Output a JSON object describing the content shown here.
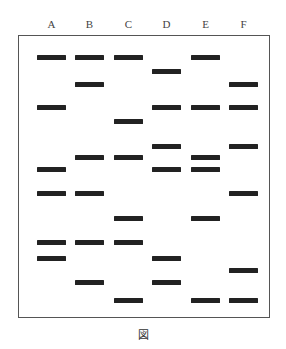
{
  "lanes": [
    {
      "label": "A",
      "x": 37,
      "bands": [
        57,
        107,
        169,
        193,
        242,
        258
      ]
    },
    {
      "label": "B",
      "x": 75,
      "bands": [
        57,
        84,
        157,
        193,
        242,
        282
      ]
    },
    {
      "label": "C",
      "x": 114,
      "bands": [
        57,
        121,
        157,
        218,
        242,
        300
      ]
    },
    {
      "label": "D",
      "x": 152,
      "bands": [
        71,
        107,
        146,
        169,
        258,
        282
      ]
    },
    {
      "label": "E",
      "x": 191,
      "bands": [
        57,
        107,
        157,
        169,
        218,
        300
      ]
    },
    {
      "label": "F",
      "x": 229,
      "bands": [
        84,
        107,
        146,
        193,
        270,
        300
      ]
    }
  ],
  "caption": "図",
  "colors": {
    "band": "#222222",
    "border": "#555555"
  }
}
